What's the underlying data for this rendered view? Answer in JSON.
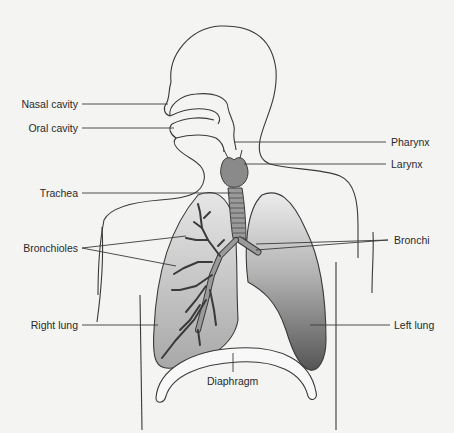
{
  "diagram": {
    "colors": {
      "background": "#f4f4f3",
      "outline": "#3a3a3a",
      "leader_line": "#3a3a3a",
      "label_text": "#2a2a2a",
      "larynx_fill": "#8a8a8a",
      "trachea_fill": "#9a9a9a",
      "right_lung_top": "#e4e4e4",
      "right_lung_bottom": "#a9a9a9",
      "left_lung_top": "#e8e8e8",
      "left_lung_bottom": "#5e5e5e",
      "diaphragm_fill": "#f8f8f8"
    },
    "labels_left": [
      {
        "id": "nasal-cavity",
        "text": "Nasal cavity"
      },
      {
        "id": "oral-cavity",
        "text": "Oral cavity"
      },
      {
        "id": "trachea",
        "text": "Trachea"
      },
      {
        "id": "bronchioles",
        "text": "Bronchioles"
      },
      {
        "id": "right-lung",
        "text": "Right lung"
      }
    ],
    "labels_right": [
      {
        "id": "pharynx",
        "text": "Pharynx"
      },
      {
        "id": "larynx",
        "text": "Larynx"
      },
      {
        "id": "bronchi",
        "text": "Bronchi"
      },
      {
        "id": "left-lung",
        "text": "Left lung"
      }
    ],
    "labels_bottom": [
      {
        "id": "diaphragm",
        "text": "Diaphragm"
      }
    ]
  }
}
